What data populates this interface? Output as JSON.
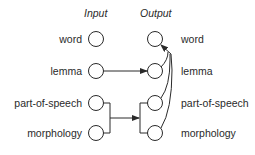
{
  "headers": {
    "input": "Input",
    "output": "Output"
  },
  "inputs": [
    {
      "label": "word"
    },
    {
      "label": "lemma"
    },
    {
      "label": "part-of-speech"
    },
    {
      "label": "morphology"
    }
  ],
  "outputs": [
    {
      "label": "word"
    },
    {
      "label": "lemma"
    },
    {
      "label": "part-of-speech"
    },
    {
      "label": "morphology"
    }
  ],
  "connections": [
    {
      "from": "input.lemma",
      "to": "output.lemma"
    },
    {
      "from": [
        "input.part-of-speech",
        "input.morphology"
      ],
      "to": [
        "output.part-of-speech",
        "output.morphology"
      ]
    },
    {
      "from": [
        "output.lemma",
        "output.part-of-speech",
        "output.morphology"
      ],
      "to": "output.word"
    }
  ],
  "colors": {
    "stroke": "#2a2a2a",
    "background": "#ffffff"
  }
}
